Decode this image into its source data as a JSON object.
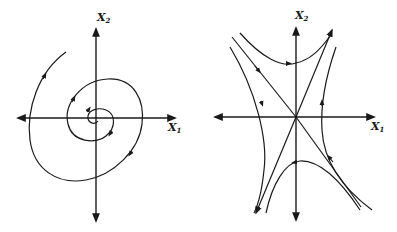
{
  "figure": {
    "left_panel": {
      "name": "stable-spiral-phase-portrait",
      "x_axis_label": "X",
      "x_axis_sub": "1",
      "y_axis_label": "X",
      "y_axis_sub": "2"
    },
    "right_panel": {
      "name": "saddle-point-phase-portrait",
      "x_axis_label": "X",
      "x_axis_sub": "1",
      "y_axis_label": "X",
      "y_axis_sub": "2"
    },
    "colors": {
      "stroke": "#1a1a1a",
      "background": "#ffffff"
    }
  }
}
